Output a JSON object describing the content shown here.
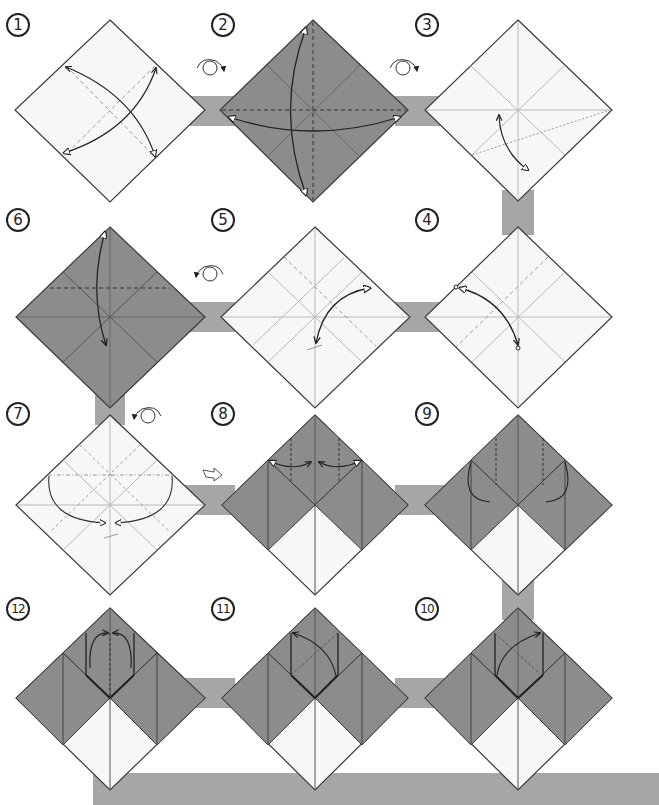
{
  "colors": {
    "background": "#ffffff",
    "connector": "#a6a6a6",
    "paper_white": "#f7f7f7",
    "paper_colored": "#8c8c8c",
    "outline": "#3a3a3a",
    "crease": "#b8b8b8",
    "arrow": "#222222"
  },
  "steps": [
    {
      "number": "1",
      "label_pos": [
        6,
        13
      ],
      "center": [
        110,
        110
      ],
      "face": "white",
      "action": "valley fold diagonals and unfold"
    },
    {
      "number": "2",
      "label_pos": [
        211,
        13
      ],
      "center": [
        313,
        110
      ],
      "face": "colored",
      "action": "valley fold in half both ways and unfold",
      "pre_icon": "turn-over-icon"
    },
    {
      "number": "3",
      "label_pos": [
        415,
        13
      ],
      "center": [
        518,
        110
      ],
      "face": "white",
      "action": "pinch fold, bring corner to center line",
      "pre_icon": "turn-over-icon"
    },
    {
      "number": "4",
      "label_pos": [
        415,
        208
      ],
      "center": [
        518,
        317
      ],
      "face": "white",
      "action": "fold edge to point and unfold"
    },
    {
      "number": "5",
      "label_pos": [
        211,
        208
      ],
      "center": [
        315,
        317
      ],
      "face": "white",
      "action": "fold and unfold"
    },
    {
      "number": "6",
      "label_pos": [
        6,
        208
      ],
      "center": [
        110,
        317
      ],
      "face": "colored",
      "action": "fold top corner down and unfold",
      "pre_icon": "turn-over-icon"
    },
    {
      "number": "7",
      "label_pos": [
        6,
        402
      ],
      "center": [
        110,
        505
      ],
      "face": "white",
      "action": "collapse side corners down along creases",
      "pre_icon": "turn-over-icon"
    },
    {
      "number": "8",
      "label_pos": [
        211,
        402
      ],
      "center": [
        315,
        505
      ],
      "face": "split",
      "action": "fold corners to center and unfold",
      "pre_icon": "result-arrow-icon"
    },
    {
      "number": "9",
      "label_pos": [
        415,
        402
      ],
      "center": [
        518,
        505
      ],
      "face": "split",
      "action": "squash-fold flaps inside"
    },
    {
      "number": "10",
      "label_pos": [
        415,
        597
      ],
      "center": [
        518,
        698
      ],
      "face": "split",
      "action": "fold flap across diagonal"
    },
    {
      "number": "11",
      "label_pos": [
        211,
        597
      ],
      "center": [
        315,
        698
      ],
      "face": "split",
      "action": "fold flap back across diagonal"
    },
    {
      "number": "12",
      "label_pos": [
        6,
        597
      ],
      "center": [
        110,
        698
      ],
      "face": "split",
      "action": "fold both edges to center meeting point"
    }
  ],
  "connectors": [
    {
      "from": "1",
      "to": "2",
      "orientation": "horizontal"
    },
    {
      "from": "2",
      "to": "3",
      "orientation": "horizontal"
    },
    {
      "from": "3",
      "to": "4",
      "orientation": "vertical"
    },
    {
      "from": "4",
      "to": "5",
      "orientation": "horizontal"
    },
    {
      "from": "5",
      "to": "6",
      "orientation": "horizontal"
    },
    {
      "from": "6",
      "to": "7",
      "orientation": "vertical"
    },
    {
      "from": "7",
      "to": "8",
      "orientation": "horizontal"
    },
    {
      "from": "8",
      "to": "9",
      "orientation": "horizontal"
    },
    {
      "from": "9",
      "to": "10",
      "orientation": "vertical"
    },
    {
      "from": "10",
      "to": "11",
      "orientation": "horizontal"
    },
    {
      "from": "11",
      "to": "12",
      "orientation": "horizontal"
    },
    {
      "from": "12",
      "to": "bottom",
      "orientation": "bottom-band"
    }
  ],
  "icons": {
    "turn_over": "turn-over-icon",
    "result_arrow": "result-arrow-icon"
  }
}
